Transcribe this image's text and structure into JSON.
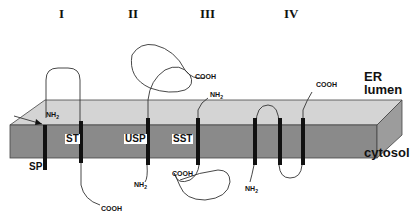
{
  "columns": [
    {
      "id": "I",
      "label": "I"
    },
    {
      "id": "II",
      "label": "II"
    },
    {
      "id": "III",
      "label": "III"
    },
    {
      "id": "IV",
      "label": "IV"
    }
  ],
  "regions": {
    "er_lumen_line1": "ER",
    "er_lumen_line2": "lumen",
    "cytosol": "cytosol"
  },
  "segments": {
    "sp": "SP",
    "st": "ST",
    "usp": "USP",
    "sst": "SST"
  },
  "termini": {
    "nh2": "NH",
    "nh2_sub": "2",
    "cooh": "COOH"
  },
  "colors": {
    "slab_top": "#d4d4d4",
    "slab_front": "#8a8a8a",
    "slab_side": "#9c9c9c",
    "helix": "#111111",
    "chain": "#333333"
  }
}
